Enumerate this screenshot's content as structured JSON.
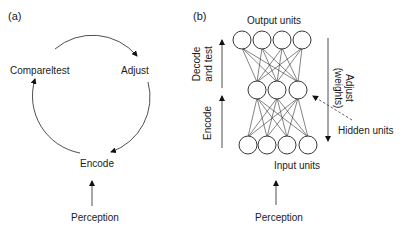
{
  "panel_a": {
    "label": "(a)",
    "cycle_nodes": {
      "compare": "Compareltest",
      "adjust": "Adjust",
      "encode": "Encode"
    },
    "input": "Perception"
  },
  "panel_b": {
    "label": "(b)",
    "layers": {
      "output": {
        "label": "Output units",
        "count": 4
      },
      "hidden": {
        "label": "Hidden units",
        "count": 3
      },
      "input": {
        "label": "Input units",
        "count": 4
      }
    },
    "left_arrows": {
      "decode_line1": "Decode",
      "decode_line2": "and test",
      "encode": "Encode"
    },
    "right_arrow": {
      "line1": "Adjust",
      "line2": "(weights)"
    },
    "input": "Perception"
  },
  "colors": {
    "stroke": "#222222",
    "background": "#ffffff"
  }
}
